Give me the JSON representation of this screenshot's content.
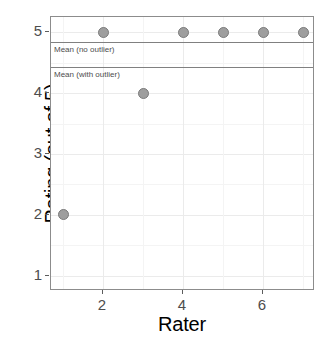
{
  "chart_data": {
    "type": "scatter",
    "title": "",
    "xlabel": "Rater",
    "ylabel": "Rating (out of 5)",
    "x": [
      1,
      2,
      3,
      4,
      5,
      6,
      7
    ],
    "values": [
      2,
      5,
      4,
      5,
      5,
      5,
      5
    ],
    "points": [
      {
        "x": 1,
        "y": 2
      },
      {
        "x": 2,
        "y": 5
      },
      {
        "x": 3,
        "y": 4
      },
      {
        "x": 4,
        "y": 5
      },
      {
        "x": 5,
        "y": 5
      },
      {
        "x": 6,
        "y": 5
      },
      {
        "x": 7,
        "y": 5
      }
    ],
    "xlim": [
      0.7,
      7.3
    ],
    "ylim": [
      0.75,
      5.25
    ],
    "xticks": [
      2,
      4,
      6
    ],
    "xticklabels": [
      "2",
      "4",
      "6"
    ],
    "yticks": [
      1,
      2,
      3,
      4,
      5
    ],
    "yticklabels": [
      "1",
      "2",
      "3",
      "4",
      "5"
    ],
    "grid": true,
    "legend": false,
    "reference_lines": [
      {
        "label": "Mean (no outlier)",
        "y": 4.833,
        "color": "#808080"
      },
      {
        "label": "Mean (with outlier)",
        "y": 4.429,
        "color": "#808080"
      }
    ],
    "point_color": "#9e9e9e",
    "point_border_color": "#7a7a7a",
    "panel_border_color": "#8c8c8c",
    "grid_color": "#ebebeb",
    "background": "#ffffff"
  }
}
